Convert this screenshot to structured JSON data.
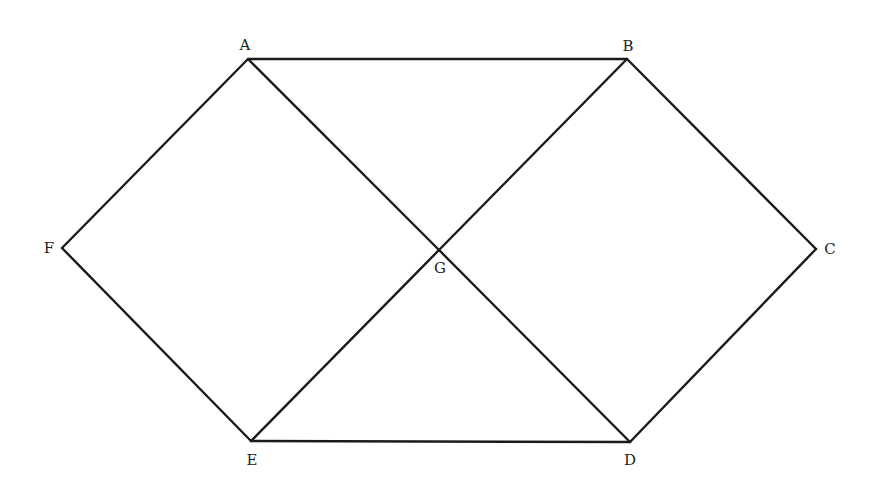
{
  "diagram": {
    "type": "graph",
    "vertices": [
      {
        "id": "A",
        "label": "A",
        "x": 248,
        "y": 59,
        "label_x": 245,
        "label_y": 50
      },
      {
        "id": "B",
        "label": "B",
        "x": 627,
        "y": 59,
        "label_x": 628,
        "label_y": 51
      },
      {
        "id": "C",
        "label": "C",
        "x": 816,
        "y": 249,
        "label_x": 830,
        "label_y": 254
      },
      {
        "id": "D",
        "label": "D",
        "x": 630,
        "y": 442,
        "label_x": 630,
        "label_y": 465
      },
      {
        "id": "E",
        "label": "E",
        "x": 251,
        "y": 441,
        "label_x": 252,
        "label_y": 465
      },
      {
        "id": "F",
        "label": "F",
        "x": 62,
        "y": 248,
        "label_x": 49,
        "label_y": 253
      },
      {
        "id": "G",
        "label": "G",
        "x": 439,
        "y": 250,
        "label_x": 440,
        "label_y": 273
      }
    ],
    "edges": [
      [
        "A",
        "B"
      ],
      [
        "B",
        "C"
      ],
      [
        "C",
        "D"
      ],
      [
        "D",
        "E"
      ],
      [
        "E",
        "F"
      ],
      [
        "F",
        "A"
      ],
      [
        "A",
        "G"
      ],
      [
        "G",
        "D"
      ],
      [
        "B",
        "G"
      ],
      [
        "G",
        "E"
      ]
    ]
  }
}
